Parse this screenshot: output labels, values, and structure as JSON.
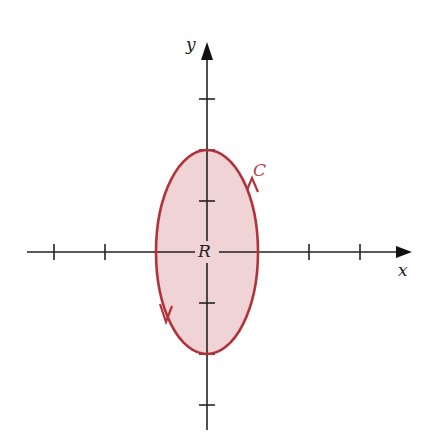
{
  "diagram": {
    "type": "region-with-boundary-curve",
    "labels": {
      "x_axis": "x",
      "y_axis": "y",
      "curve": "C",
      "region": "R"
    },
    "origin_px": [
      207,
      252
    ],
    "tick_spacing_px": 51,
    "x_ticks": [
      -3,
      -2,
      -1,
      1,
      2,
      3
    ],
    "y_ticks": [
      3,
      2,
      1,
      -1,
      -2,
      -3
    ],
    "ellipse": {
      "center": [
        0,
        0
      ],
      "semi_axis_x": 1,
      "semi_axis_y": 2,
      "orientation": "counterclockwise"
    },
    "colors": {
      "axis": "#222222",
      "curve": "#b0323a",
      "region_fill": "#efd3d5",
      "curve_label": "#b0464c"
    }
  }
}
